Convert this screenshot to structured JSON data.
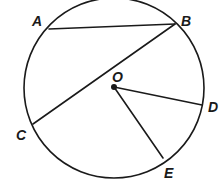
{
  "diagram": {
    "colors": {
      "stroke": "#1a1a1a",
      "background": "#ffffff"
    },
    "circle": {
      "center_label": "O",
      "cx": 114,
      "cy": 88,
      "r": 90
    },
    "points": {
      "A": {
        "label": "A",
        "x": 49,
        "y": 29
      },
      "B": {
        "label": "B",
        "x": 175,
        "y": 24
      },
      "C": {
        "label": "C",
        "x": 33,
        "y": 124
      },
      "D": {
        "label": "D",
        "x": 202,
        "y": 105
      },
      "E": {
        "label": "E",
        "x": 163,
        "y": 158
      },
      "O": {
        "label": "O",
        "x": 114,
        "y": 87
      }
    },
    "segments": [
      {
        "name": "chord-AB",
        "from": "A",
        "to": "B"
      },
      {
        "name": "chord-BC",
        "from": "B",
        "to": "C"
      },
      {
        "name": "radius-OD",
        "from": "O",
        "to": "D"
      },
      {
        "name": "radius-OE",
        "from": "O",
        "to": "E"
      }
    ]
  }
}
